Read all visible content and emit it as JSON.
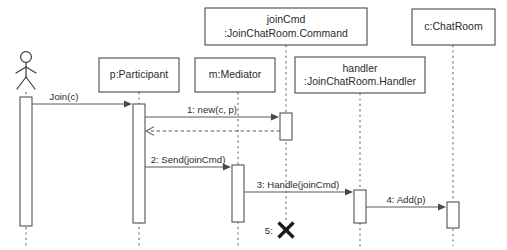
{
  "diagram": {
    "type": "uml-sequence-diagram",
    "title": "",
    "width": 507,
    "height": 250,
    "background_color": "#ffffff",
    "line_color": "#4a4a4a",
    "text_color": "#2b2b2b"
  },
  "participants": [
    {
      "id": "actor",
      "kind": "actor",
      "label": "",
      "label_line1": "",
      "label_line2": "",
      "lifeline_x": 26,
      "box": null,
      "activation": {
        "x": 20,
        "y": 97,
        "w": 12,
        "h": 129
      },
      "lifeline_top": 92,
      "lifeline_bottom": 246
    },
    {
      "id": "participant",
      "kind": "object",
      "label": "p:Participant",
      "label_line1": "p:Participant",
      "label_line2": "",
      "lifeline_x": 139,
      "box": {
        "x": 99,
        "y": 58,
        "w": 80,
        "h": 34
      },
      "activation": {
        "x": 133,
        "y": 104,
        "w": 12,
        "h": 119
      },
      "lifeline_top": 92,
      "lifeline_bottom": 246
    },
    {
      "id": "mediator",
      "kind": "object",
      "label": "m:Mediator",
      "label_line1": "m:Mediator",
      "label_line2": "",
      "lifeline_x": 238,
      "box": {
        "x": 195,
        "y": 58,
        "w": 80,
        "h": 34
      },
      "activation": {
        "x": 232,
        "y": 165,
        "w": 12,
        "h": 57
      },
      "lifeline_top": 92,
      "lifeline_bottom": 246
    },
    {
      "id": "joincmd",
      "kind": "object",
      "label": "joinCmd :JoinChatRoom.Command",
      "label_line1": "joinCmd",
      "label_line2": ":JoinChatRoom.Command",
      "lifeline_x": 286,
      "box": {
        "x": 205,
        "y": 8,
        "w": 162,
        "h": 37
      },
      "activation": {
        "x": 280,
        "y": 113,
        "w": 12,
        "h": 27
      },
      "lifeline_top": 45,
      "lifeline_bottom": 221
    },
    {
      "id": "handler",
      "kind": "object",
      "label": "handler :JoinChatRoom.Handler",
      "label_line1": "handler",
      "label_line2": ":JoinChatRoom.Handler",
      "lifeline_x": 360,
      "box": {
        "x": 295,
        "y": 57,
        "w": 130,
        "h": 36
      },
      "activation": {
        "x": 354,
        "y": 190,
        "w": 12,
        "h": 33
      },
      "lifeline_top": 93,
      "lifeline_bottom": 246
    },
    {
      "id": "chatroom",
      "kind": "object",
      "label": "c:ChatRoom",
      "label_line1": "c:ChatRoom",
      "label_line2": "",
      "lifeline_x": 453,
      "box": {
        "x": 412,
        "y": 9,
        "w": 83,
        "h": 36
      },
      "activation": {
        "x": 447,
        "y": 202,
        "w": 12,
        "h": 26
      },
      "lifeline_top": 45,
      "lifeline_bottom": 246
    }
  ],
  "messages": [
    {
      "id": "msg-join",
      "number": "",
      "label": "Join(c)",
      "from": "actor",
      "to": "participant",
      "style": "solid",
      "arrow": "filled",
      "x1": 32,
      "x2": 132,
      "y": 104,
      "label_x": 64,
      "label_y": 100
    },
    {
      "id": "msg-1-new",
      "number": "1",
      "label": "1: new(c, p)",
      "from": "participant",
      "to": "joincmd",
      "style": "solid",
      "arrow": "filled",
      "x1": 145,
      "x2": 279,
      "y": 117,
      "label_x": 212,
      "label_y": 113
    },
    {
      "id": "msg-return",
      "number": "",
      "label": "",
      "from": "joincmd",
      "to": "participant",
      "style": "dashed",
      "arrow": "open",
      "x1": 280,
      "x2": 146,
      "y": 131,
      "label_x": 0,
      "label_y": 0
    },
    {
      "id": "msg-2-send",
      "number": "2",
      "label": "2: Send(joinCmd)",
      "from": "participant",
      "to": "mediator",
      "style": "solid",
      "arrow": "filled",
      "x1": 145,
      "x2": 231,
      "y": 167,
      "label_x": 188,
      "label_y": 163
    },
    {
      "id": "msg-3-handle",
      "number": "3",
      "label": "3: Handle(joinCmd)",
      "from": "mediator",
      "to": "handler",
      "style": "solid",
      "arrow": "filled",
      "x1": 244,
      "x2": 353,
      "y": 192,
      "label_x": 298,
      "label_y": 188
    },
    {
      "id": "msg-4-add",
      "number": "4",
      "label": "4: Add(p)",
      "from": "handler",
      "to": "chatroom",
      "style": "solid",
      "arrow": "filled",
      "x1": 366,
      "x2": 446,
      "y": 207,
      "label_x": 406,
      "label_y": 203
    }
  ],
  "destruction": {
    "id": "destroy-joincmd",
    "label": "5:",
    "target": "joincmd",
    "x": 286,
    "y": 230,
    "size": 9,
    "label_x": 276,
    "label_y": 234
  }
}
